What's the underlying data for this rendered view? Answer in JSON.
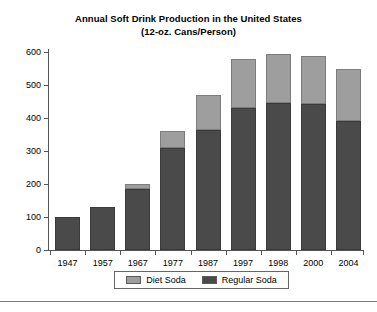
{
  "chart_data": {
    "type": "bar",
    "subtype": "stacked-vertical",
    "title": "Annual Soft Drink Production in the United States (12-oz. Cans/Person)",
    "title_lines": [
      "Annual Soft Drink Production in the United States",
      "(12-oz. Cans/Person)"
    ],
    "xlabel": "",
    "ylabel": "",
    "ylim": [
      0,
      600
    ],
    "yticks": [
      0,
      100,
      200,
      300,
      400,
      500,
      600
    ],
    "ytick_labels": [
      "0",
      "100",
      "200",
      "300",
      "400",
      "500",
      "600"
    ],
    "grid": false,
    "legend_position": "bottom-center",
    "categories": [
      "1947",
      "1957",
      "1967",
      "1977",
      "1987",
      "1997",
      "1998",
      "2000",
      "2004"
    ],
    "series": [
      {
        "name": "Regular Soda",
        "color": "#4a4a4a",
        "values": [
          100,
          130,
          185,
          310,
          365,
          430,
          445,
          443,
          390
        ]
      },
      {
        "name": "Diet Soda",
        "color": "#9e9e9e",
        "values": [
          0,
          0,
          15,
          50,
          105,
          150,
          150,
          145,
          160
        ]
      }
    ],
    "totals": [
      100,
      130,
      200,
      360,
      470,
      580,
      595,
      588,
      550
    ],
    "stack_order": [
      "Regular Soda",
      "Diet Soda"
    ]
  },
  "legend": {
    "items": [
      {
        "label": "Diet Soda",
        "color": "#9e9e9e"
      },
      {
        "label": "Regular Soda",
        "color": "#4a4a4a"
      }
    ]
  },
  "colors": {
    "diet_soda": "#9e9e9e",
    "regular_soda": "#4a4a4a",
    "axis": "#555555",
    "background": "#ffffff",
    "text": "#000000"
  }
}
